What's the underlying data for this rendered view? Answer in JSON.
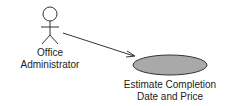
{
  "diagram": {
    "type": "use-case",
    "actor": {
      "name_line1": "Office",
      "name_line2": "Administrator"
    },
    "use_case": {
      "name_line1": "Estimate Completion",
      "name_line2": "Date and Price",
      "fill_color": "#a9a9a9"
    },
    "association": {
      "from": "Office Administrator",
      "to": "Estimate Completion Date and Price",
      "arrow": "open"
    }
  }
}
